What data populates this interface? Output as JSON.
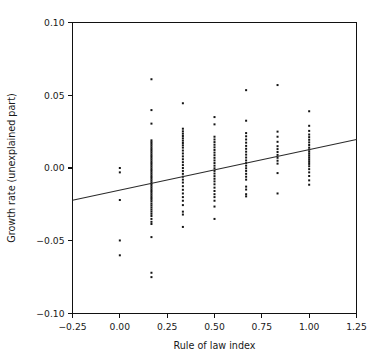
{
  "figure": {
    "background": "#ffffff",
    "frame_color": "#111111",
    "point_color": "#141414",
    "line_color": "#2b2b2b"
  },
  "chart_data": {
    "type": "scatter",
    "title": "",
    "xlabel": "Rule of law index",
    "ylabel": "Growth rate (unexplained part)",
    "xlim": [
      -0.25,
      1.25
    ],
    "ylim": [
      -0.1,
      0.1
    ],
    "xticks": [
      -0.25,
      0.0,
      0.25,
      0.5,
      0.75,
      1.0,
      1.25
    ],
    "xticklabels": [
      "−0.25",
      "0.00",
      "0.25",
      "0.50",
      "0.75",
      "1.00",
      "1.25"
    ],
    "yticks": [
      -0.1,
      -0.05,
      0.0,
      0.05,
      0.1
    ],
    "yticklabels": [
      "−0.10",
      "−0.05",
      "0.00",
      "0.05",
      "0.10"
    ],
    "grid": false,
    "legend": null,
    "marker": "small-square",
    "marker_size_px": 2.0,
    "trendline": {
      "name": "fitted regression line",
      "x": [
        -0.25,
        1.25
      ],
      "y": [
        -0.0222,
        0.0196
      ],
      "slope": 0.0279,
      "intercept": -0.0152
    },
    "series": [
      {
        "name": "countries",
        "points": [
          [
            0.0,
            0.0
          ],
          [
            0.0,
            -0.003
          ],
          [
            0.0,
            -0.022
          ],
          [
            0.0,
            -0.0498
          ],
          [
            0.0,
            -0.06
          ],
          [
            0.167,
            0.061
          ],
          [
            0.167,
            0.0398
          ],
          [
            0.167,
            0.0305
          ],
          [
            0.167,
            0.019
          ],
          [
            0.167,
            0.0178
          ],
          [
            0.167,
            0.0166
          ],
          [
            0.167,
            0.0154
          ],
          [
            0.167,
            0.0142
          ],
          [
            0.167,
            0.013
          ],
          [
            0.167,
            0.0118
          ],
          [
            0.167,
            0.0106
          ],
          [
            0.167,
            0.0094
          ],
          [
            0.167,
            0.0082
          ],
          [
            0.167,
            0.007
          ],
          [
            0.167,
            0.0058
          ],
          [
            0.167,
            0.0046
          ],
          [
            0.167,
            0.0034
          ],
          [
            0.167,
            0.0022
          ],
          [
            0.167,
            0.001
          ],
          [
            0.167,
            -0.0002
          ],
          [
            0.167,
            -0.0014
          ],
          [
            0.167,
            -0.0026
          ],
          [
            0.167,
            -0.0038
          ],
          [
            0.167,
            -0.005
          ],
          [
            0.167,
            -0.0062
          ],
          [
            0.167,
            -0.0074
          ],
          [
            0.167,
            -0.0086
          ],
          [
            0.167,
            -0.0098
          ],
          [
            0.167,
            -0.011
          ],
          [
            0.167,
            -0.0122
          ],
          [
            0.167,
            -0.0134
          ],
          [
            0.167,
            -0.0146
          ],
          [
            0.167,
            -0.0158
          ],
          [
            0.167,
            -0.017
          ],
          [
            0.167,
            -0.0182
          ],
          [
            0.167,
            -0.0194
          ],
          [
            0.167,
            -0.0206
          ],
          [
            0.167,
            -0.0218
          ],
          [
            0.167,
            -0.023
          ],
          [
            0.167,
            -0.0245
          ],
          [
            0.167,
            -0.0258
          ],
          [
            0.167,
            -0.0272
          ],
          [
            0.167,
            -0.0286
          ],
          [
            0.167,
            -0.03
          ],
          [
            0.167,
            -0.0315
          ],
          [
            0.167,
            -0.033
          ],
          [
            0.167,
            -0.035
          ],
          [
            0.167,
            -0.037
          ],
          [
            0.167,
            -0.0385
          ],
          [
            0.167,
            -0.0475
          ],
          [
            0.167,
            -0.072
          ],
          [
            0.167,
            -0.075
          ],
          [
            0.333,
            0.0445
          ],
          [
            0.333,
            0.027
          ],
          [
            0.333,
            0.0252
          ],
          [
            0.333,
            0.0236
          ],
          [
            0.333,
            0.022
          ],
          [
            0.333,
            0.0204
          ],
          [
            0.333,
            0.0188
          ],
          [
            0.333,
            0.0172
          ],
          [
            0.333,
            0.0156
          ],
          [
            0.333,
            0.014
          ],
          [
            0.333,
            0.012
          ],
          [
            0.333,
            0.01
          ],
          [
            0.333,
            0.008
          ],
          [
            0.333,
            0.006
          ],
          [
            0.333,
            0.004
          ],
          [
            0.333,
            0.002
          ],
          [
            0.333,
            0.0
          ],
          [
            0.333,
            -0.002
          ],
          [
            0.333,
            -0.004
          ],
          [
            0.333,
            -0.006
          ],
          [
            0.333,
            -0.008
          ],
          [
            0.333,
            -0.01
          ],
          [
            0.333,
            -0.0125
          ],
          [
            0.333,
            -0.015
          ],
          [
            0.333,
            -0.0175
          ],
          [
            0.333,
            -0.02
          ],
          [
            0.333,
            -0.0225
          ],
          [
            0.333,
            -0.0255
          ],
          [
            0.333,
            -0.03
          ],
          [
            0.333,
            -0.032
          ],
          [
            0.333,
            -0.0405
          ],
          [
            0.5,
            0.035
          ],
          [
            0.5,
            0.03
          ],
          [
            0.5,
            0.0215
          ],
          [
            0.5,
            0.0196
          ],
          [
            0.5,
            0.0178
          ],
          [
            0.5,
            0.016
          ],
          [
            0.5,
            0.0142
          ],
          [
            0.5,
            0.0124
          ],
          [
            0.5,
            0.0106
          ],
          [
            0.5,
            0.0088
          ],
          [
            0.5,
            0.007
          ],
          [
            0.5,
            0.0052
          ],
          [
            0.5,
            0.0034
          ],
          [
            0.5,
            0.0016
          ],
          [
            0.5,
            -0.0002
          ],
          [
            0.5,
            -0.002
          ],
          [
            0.5,
            -0.0038
          ],
          [
            0.5,
            -0.0056
          ],
          [
            0.5,
            -0.0074
          ],
          [
            0.5,
            -0.0092
          ],
          [
            0.5,
            -0.0112
          ],
          [
            0.5,
            -0.0135
          ],
          [
            0.5,
            -0.0158
          ],
          [
            0.5,
            -0.018
          ],
          [
            0.5,
            -0.02
          ],
          [
            0.5,
            -0.0225
          ],
          [
            0.5,
            -0.0265
          ],
          [
            0.5,
            -0.035
          ],
          [
            0.667,
            0.0535
          ],
          [
            0.667,
            0.0325
          ],
          [
            0.667,
            0.024
          ],
          [
            0.667,
            0.0218
          ],
          [
            0.667,
            0.0196
          ],
          [
            0.667,
            0.0174
          ],
          [
            0.667,
            0.0152
          ],
          [
            0.667,
            0.0132
          ],
          [
            0.667,
            0.0112
          ],
          [
            0.667,
            0.0092
          ],
          [
            0.667,
            0.0072
          ],
          [
            0.667,
            0.0052
          ],
          [
            0.667,
            0.0034
          ],
          [
            0.667,
            0.0016
          ],
          [
            0.667,
            -0.0002
          ],
          [
            0.667,
            -0.002
          ],
          [
            0.667,
            -0.004
          ],
          [
            0.667,
            -0.006
          ],
          [
            0.667,
            -0.008
          ],
          [
            0.667,
            -0.0128
          ],
          [
            0.667,
            -0.0148
          ],
          [
            0.667,
            -0.018
          ],
          [
            0.667,
            -0.0195
          ],
          [
            0.833,
            0.057
          ],
          [
            0.833,
            0.025
          ],
          [
            0.833,
            0.0215
          ],
          [
            0.833,
            0.018
          ],
          [
            0.833,
            0.015
          ],
          [
            0.833,
            0.013
          ],
          [
            0.833,
            0.011
          ],
          [
            0.833,
            0.009
          ],
          [
            0.833,
            0.007
          ],
          [
            0.833,
            0.005
          ],
          [
            0.833,
            0.003
          ],
          [
            0.833,
            -0.0035
          ],
          [
            0.833,
            -0.0175
          ],
          [
            1.0,
            0.039
          ],
          [
            1.0,
            0.029
          ],
          [
            1.0,
            0.0255
          ],
          [
            1.0,
            0.023
          ],
          [
            1.0,
            0.0212
          ],
          [
            1.0,
            0.0194
          ],
          [
            1.0,
            0.0176
          ],
          [
            1.0,
            0.0158
          ],
          [
            1.0,
            0.014
          ],
          [
            1.0,
            0.0126
          ],
          [
            1.0,
            0.0112
          ],
          [
            1.0,
            0.0098
          ],
          [
            1.0,
            0.0084
          ],
          [
            1.0,
            0.007
          ],
          [
            1.0,
            0.0056
          ],
          [
            1.0,
            0.0042
          ],
          [
            1.0,
            0.0028
          ],
          [
            1.0,
            0.0012
          ],
          [
            1.0,
            -0.0008
          ],
          [
            1.0,
            -0.003
          ],
          [
            1.0,
            -0.0055
          ],
          [
            1.0,
            -0.0085
          ],
          [
            1.0,
            -0.0115
          ]
        ]
      }
    ]
  }
}
